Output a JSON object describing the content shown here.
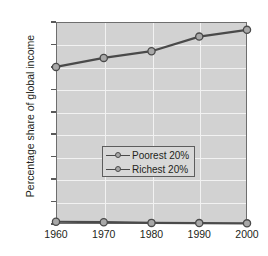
{
  "chart_data": {
    "type": "line",
    "title": "",
    "xlabel": "",
    "ylabel": "Percentage share of global income",
    "x": [
      1960,
      1970,
      1980,
      1990,
      2000
    ],
    "xticklabels": [
      "1960",
      "1970",
      "1980",
      "1990",
      "2000"
    ],
    "yticklabels": [
      "0",
      "10",
      "20",
      "30",
      "40",
      "50",
      "60",
      "70",
      "80",
      "90"
    ],
    "yticks": [
      0,
      10,
      20,
      30,
      40,
      50,
      60,
      70,
      80,
      90
    ],
    "ylim": [
      0,
      90
    ],
    "xlim": [
      1960,
      2000
    ],
    "grid": true,
    "legend_position": "center",
    "series": [
      {
        "name": "Poorest 20%",
        "values": [
          1.0,
          0.8,
          0.5,
          0.4,
          0.3
        ],
        "color": "#4a4a4a",
        "marker_fill": "#a8a8a8"
      },
      {
        "name": "Richest 20%",
        "values": [
          70,
          74,
          77,
          83.5,
          86.5
        ],
        "color": "#4a4a4a",
        "marker_fill": "#a8a8a8"
      }
    ],
    "plot_background": "#d2d2d2",
    "gridline_color": "#f2f2f2",
    "axis_color": "#6e6e6e",
    "text_color": "#231f20"
  },
  "legend": {
    "entries": [
      {
        "label": "Poorest 20%"
      },
      {
        "label": "Richest 20%"
      }
    ]
  }
}
